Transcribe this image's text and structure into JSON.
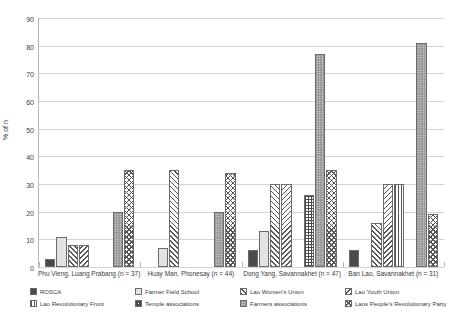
{
  "chart_data": {
    "type": "bar",
    "title": "",
    "xlabel": "",
    "ylabel": "% of n",
    "ylim": [
      0,
      90
    ],
    "yticks": [
      0,
      10,
      20,
      30,
      40,
      50,
      60,
      70,
      80,
      90
    ],
    "grid": true,
    "legend_position": "bottom",
    "categories": [
      "Phu Vieng, Luang Prabang (n = 37)",
      "Huay Man, Phonesay (n = 44)",
      "Dong Yang, Savannakhet (n = 47)",
      "Ban Lao, Savannakhet (n = 31)"
    ],
    "series": [
      {
        "name": "ROSCA",
        "pattern": "solid-dark",
        "values": [
          3,
          0,
          6,
          6
        ]
      },
      {
        "name": "Farmer Field School",
        "pattern": "solid-light",
        "values": [
          11,
          7,
          13,
          0
        ]
      },
      {
        "name": "Lao Women's Union",
        "pattern": "hatch-fwd",
        "values": [
          8,
          35,
          30,
          16
        ]
      },
      {
        "name": "Lao Youth Union",
        "pattern": "hatch-back",
        "values": [
          8,
          0,
          30,
          30
        ]
      },
      {
        "name": "Lao Revolutionary Front",
        "pattern": "vert",
        "values": [
          0,
          0,
          0,
          30
        ]
      },
      {
        "name": "Temple associations",
        "pattern": "checker",
        "values": [
          0,
          0,
          26,
          0
        ]
      },
      {
        "name": "Farmers associations",
        "pattern": "dots",
        "values": [
          20,
          20,
          77,
          81
        ]
      },
      {
        "name": "Laos People's Revolutionary Party",
        "pattern": "cross",
        "values": [
          35,
          34,
          35,
          19
        ]
      }
    ]
  }
}
